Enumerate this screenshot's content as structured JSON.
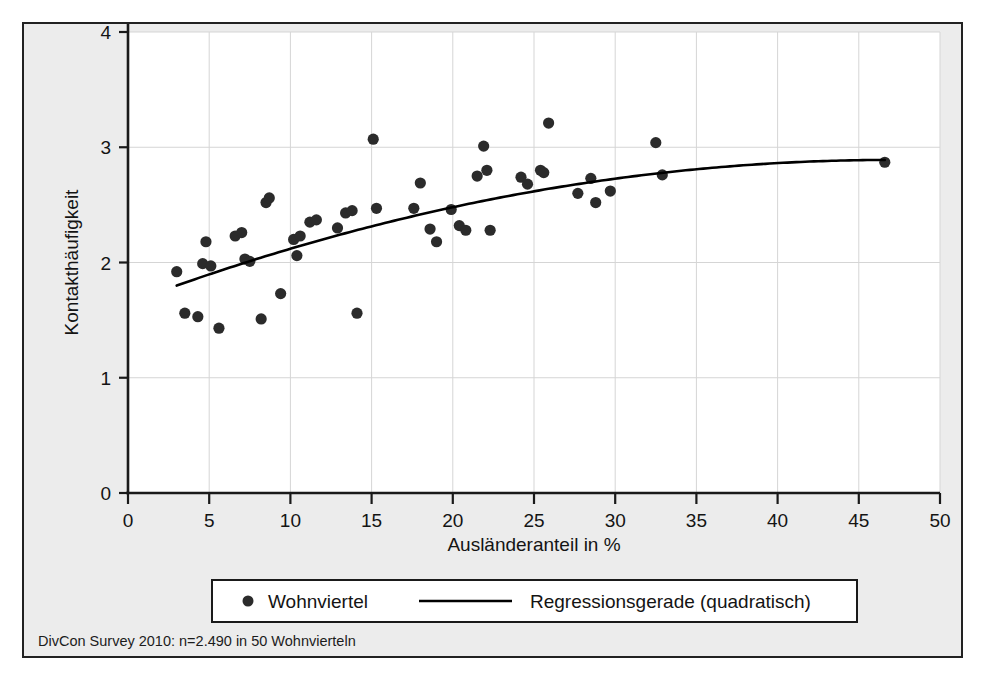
{
  "figure": {
    "plot_background": "#ffffff",
    "figure_background": "#ececec",
    "border_color": "#222222",
    "marker_color": "#2b2b2b",
    "line_color": "#000000",
    "grid_color": "#d5d5d5",
    "source_note": "DivCon Survey 2010: n=2.490 in 50 Wohnvierteln"
  },
  "legend": {
    "position": "below-axis",
    "entries": [
      {
        "label": "Wohnviertel",
        "marker": "dot"
      },
      {
        "label": "Regressionsgerade (quadratisch)",
        "marker": "line"
      }
    ]
  },
  "chart_data": {
    "type": "scatter",
    "title": "",
    "xlabel": "Ausländeranteil in %",
    "ylabel": "Kontakthäufigkeit",
    "xlim": [
      0,
      50
    ],
    "ylim": [
      0,
      4
    ],
    "xticks": [
      0,
      5,
      10,
      15,
      20,
      25,
      30,
      35,
      40,
      45,
      50
    ],
    "yticks": [
      0,
      1,
      2,
      3,
      4
    ],
    "xtick_labels": [
      "0",
      "5",
      "10",
      "15",
      "20",
      "25",
      "30",
      "35",
      "40",
      "45",
      "50"
    ],
    "ytick_labels": [
      "0",
      "1",
      "2",
      "3",
      "4"
    ],
    "grid": true,
    "grid_axis": "both",
    "series": [
      {
        "name": "Wohnviertel",
        "type": "scatter",
        "n_points": 50,
        "points": [
          [
            3.0,
            1.92
          ],
          [
            3.5,
            1.56
          ],
          [
            4.3,
            1.53
          ],
          [
            4.6,
            1.99
          ],
          [
            4.8,
            2.18
          ],
          [
            5.1,
            1.97
          ],
          [
            5.6,
            1.43
          ],
          [
            6.6,
            2.23
          ],
          [
            7.0,
            2.26
          ],
          [
            7.2,
            2.03
          ],
          [
            7.5,
            2.01
          ],
          [
            8.2,
            1.51
          ],
          [
            8.5,
            2.52
          ],
          [
            8.7,
            2.56
          ],
          [
            9.4,
            1.73
          ],
          [
            10.2,
            2.2
          ],
          [
            10.4,
            2.06
          ],
          [
            10.6,
            2.23
          ],
          [
            11.2,
            2.35
          ],
          [
            11.6,
            2.37
          ],
          [
            12.9,
            2.3
          ],
          [
            13.4,
            2.43
          ],
          [
            13.8,
            2.45
          ],
          [
            14.1,
            1.56
          ],
          [
            15.1,
            3.07
          ],
          [
            15.3,
            2.47
          ],
          [
            17.6,
            2.47
          ],
          [
            18.0,
            2.69
          ],
          [
            18.6,
            2.29
          ],
          [
            19.0,
            2.18
          ],
          [
            19.9,
            2.46
          ],
          [
            20.4,
            2.32
          ],
          [
            20.8,
            2.28
          ],
          [
            21.5,
            2.75
          ],
          [
            21.9,
            3.01
          ],
          [
            22.1,
            2.8
          ],
          [
            22.3,
            2.28
          ],
          [
            24.2,
            2.74
          ],
          [
            24.6,
            2.68
          ],
          [
            25.4,
            2.8
          ],
          [
            25.6,
            2.78
          ],
          [
            25.9,
            3.21
          ],
          [
            27.7,
            2.6
          ],
          [
            28.5,
            2.73
          ],
          [
            28.8,
            2.52
          ],
          [
            29.7,
            2.62
          ],
          [
            32.5,
            3.04
          ],
          [
            32.9,
            2.76
          ],
          [
            46.6,
            2.87
          ]
        ]
      },
      {
        "name": "Regressionsgerade (quadratisch)",
        "type": "line",
        "shape": "quadratic",
        "x_start": 3.0,
        "x_end": 46.6,
        "y_start": 1.8,
        "y_end": 2.88,
        "vertex_x": 47.0,
        "vertex_y": 2.89
      }
    ]
  }
}
